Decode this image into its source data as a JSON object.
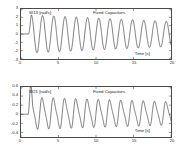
{
  "figure": {
    "background_color": "#ffffff",
    "axis_color": "#4a4a4a",
    "curve_color": "#2e2e2e"
  },
  "chart_data": [
    {
      "type": "line",
      "panel": "top",
      "title": "Fixed Capacitors",
      "series_label": "W13 [rad/s]",
      "xlabel": "Time [s]",
      "ylabel": "",
      "xlim": [
        0,
        20
      ],
      "ylim": [
        -3,
        3
      ],
      "xticks": [
        0,
        5,
        10,
        15,
        20
      ],
      "xticklabels": [
        "0",
        "5",
        "10",
        "15",
        "20"
      ],
      "yticks": [
        -3,
        -2,
        -1,
        0,
        1,
        2,
        3
      ],
      "yticklabels": [
        "-3",
        "-2",
        "-1",
        "0",
        "1",
        "2",
        "3"
      ],
      "grid": false,
      "legend": false,
      "annotations": [
        {
          "text": "W13 [rad/s]",
          "x": 1.2,
          "y": 2.62
        },
        {
          "text": "Fixed Capacitors",
          "x": 9.6,
          "y": 2.62
        },
        {
          "text": "Time [s]",
          "x": 15.1,
          "y": -2.08
        }
      ],
      "description": "Zero until t=1 s, then damped sinusoid, period approx 1.5 s, initial amplitude 2.3 decaying to 1.5",
      "waveform": {
        "start_time": 1.0,
        "period": 1.5,
        "amplitude_start": 2.3,
        "amplitude_end": 1.5,
        "offset": 0.0
      }
    },
    {
      "type": "line",
      "panel": "bottom",
      "title": "Fixed Capacitors",
      "series_label": "W21 [rad/s]",
      "xlabel": "Time [s]",
      "ylabel": "",
      "xlim": [
        0,
        20
      ],
      "ylim": [
        -0.5,
        0.6
      ],
      "xticks": [
        0,
        5,
        10,
        15,
        20
      ],
      "xticklabels": [
        "0",
        "5",
        "10",
        "15",
        "20"
      ],
      "yticks": [
        -0.4,
        -0.2,
        0,
        0.2,
        0.4,
        0.6
      ],
      "yticklabels": [
        "-0.4",
        "-0.2",
        "0",
        "0.2",
        "0.4",
        "0.6"
      ],
      "grid": false,
      "legend": false,
      "annotations": [
        {
          "text": "W21 [rad/s]",
          "x": 1.2,
          "y": 0.52
        },
        {
          "text": "Fixed Capacitors",
          "x": 9.6,
          "y": 0.52
        },
        {
          "text": "Time [s]",
          "x": 15.1,
          "y": -0.3
        }
      ],
      "description": "Zero until t=1 s, small transient spike, then asymmetric oscillation, period approx 1.5 s, peaks near 0.32 and troughs near -0.28",
      "waveform": {
        "start_time": 1.0,
        "period": 1.5,
        "amplitude_start": 0.36,
        "amplitude_end": 0.26,
        "offset": 0.02
      }
    }
  ]
}
